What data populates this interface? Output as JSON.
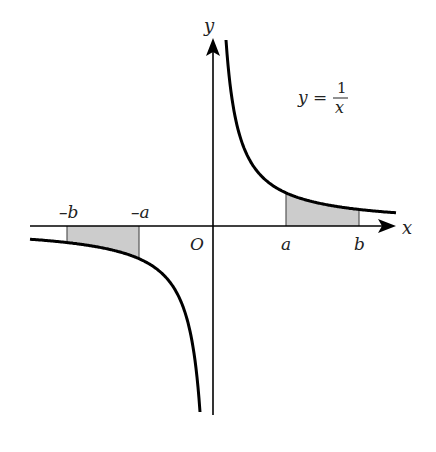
{
  "figure": {
    "equation": {
      "lhs": "y =",
      "numerator": "1",
      "denominator": "x"
    },
    "axes": {
      "x_label": "x",
      "y_label": "y",
      "origin_label": "O"
    },
    "tick_labels": {
      "neg_b": "–b",
      "neg_a": "–a",
      "a": "a",
      "b": "b"
    },
    "colors": {
      "curve": "#000000",
      "axis": "#000000",
      "shade": "#cccccc"
    }
  },
  "chart_data": {
    "type": "line",
    "xlabel": "x",
    "ylabel": "y",
    "series": [
      {
        "name": "y = 1/x (x > 0)",
        "domain": "x > 0"
      },
      {
        "name": "y = 1/x (x < 0)",
        "domain": "x < 0"
      }
    ],
    "shaded_regions": [
      {
        "from": "-b",
        "to": "-a",
        "between": "curve and x-axis"
      },
      {
        "from": "a",
        "to": "b",
        "between": "curve and x-axis"
      }
    ],
    "tick_labels": [
      "–b",
      "–a",
      "O",
      "a",
      "b"
    ],
    "grid": false
  }
}
